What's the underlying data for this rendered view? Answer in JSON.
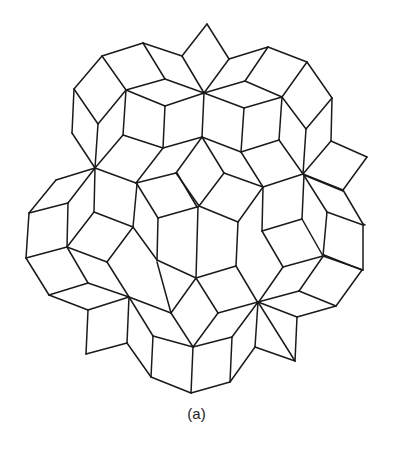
{
  "figure": {
    "caption": "(a)",
    "stroke_color": "#1a1a1a",
    "background": "#ffffff",
    "edges": [
      [
        207,
        24,
        182,
        56
      ],
      [
        207,
        24,
        229,
        59
      ],
      [
        182,
        56,
        204,
        93
      ],
      [
        229,
        59,
        204,
        93
      ],
      [
        143,
        43,
        182,
        56
      ],
      [
        143,
        43,
        102,
        56
      ],
      [
        102,
        56,
        74,
        89
      ],
      [
        143,
        43,
        165,
        79
      ],
      [
        102,
        56,
        126,
        90
      ],
      [
        74,
        89,
        98,
        124
      ],
      [
        74,
        89,
        72,
        133
      ],
      [
        98,
        124,
        126,
        90
      ],
      [
        126,
        90,
        165,
        79
      ],
      [
        165,
        79,
        204,
        93
      ],
      [
        126,
        90,
        165,
        106
      ],
      [
        165,
        106,
        204,
        93
      ],
      [
        229,
        59,
        268,
        47
      ],
      [
        268,
        47,
        307,
        62
      ],
      [
        307,
        62,
        332,
        98
      ],
      [
        268,
        47,
        245,
        81
      ],
      [
        245,
        81,
        204,
        93
      ],
      [
        245,
        81,
        282,
        97
      ],
      [
        307,
        62,
        282,
        97
      ],
      [
        282,
        97,
        306,
        129
      ],
      [
        332,
        98,
        306,
        129
      ],
      [
        332,
        98,
        331,
        141
      ],
      [
        204,
        93,
        244,
        108
      ],
      [
        244,
        108,
        282,
        97
      ],
      [
        126,
        90,
        123,
        135
      ],
      [
        165,
        106,
        163,
        148
      ],
      [
        204,
        93,
        202,
        137
      ],
      [
        244,
        108,
        241,
        152
      ],
      [
        282,
        97,
        279,
        140
      ],
      [
        123,
        135,
        163,
        148
      ],
      [
        163,
        148,
        202,
        137
      ],
      [
        202,
        137,
        241,
        152
      ],
      [
        241,
        152,
        279,
        140
      ],
      [
        98,
        124,
        95,
        168
      ],
      [
        72,
        133,
        95,
        168
      ],
      [
        123,
        135,
        95,
        168
      ],
      [
        306,
        129,
        303,
        174
      ],
      [
        279,
        140,
        303,
        174
      ],
      [
        331,
        141,
        303,
        174
      ],
      [
        95,
        168,
        136,
        183
      ],
      [
        136,
        183,
        163,
        148
      ],
      [
        136,
        183,
        176,
        173
      ],
      [
        176,
        173,
        202,
        137
      ],
      [
        202,
        137,
        224,
        173
      ],
      [
        224,
        173,
        263,
        187
      ],
      [
        263,
        187,
        241,
        152
      ],
      [
        263,
        187,
        303,
        174
      ],
      [
        176,
        173,
        199,
        206
      ],
      [
        224,
        173,
        199,
        206
      ],
      [
        331,
        141,
        367,
        157
      ],
      [
        367,
        157,
        343,
        190
      ],
      [
        303,
        174,
        343,
        190
      ],
      [
        343,
        190,
        363,
        224
      ],
      [
        303,
        174,
        327,
        212
      ],
      [
        327,
        212,
        363,
        225
      ],
      [
        95,
        168,
        56,
        180
      ],
      [
        56,
        180,
        29,
        213
      ],
      [
        95,
        168,
        68,
        203
      ],
      [
        29,
        213,
        68,
        203
      ],
      [
        95,
        168,
        94,
        212
      ],
      [
        68,
        203,
        67,
        247
      ],
      [
        29,
        213,
        26,
        258
      ],
      [
        94,
        212,
        133,
        227
      ],
      [
        133,
        227,
        137,
        184
      ],
      [
        136,
        183,
        137,
        184
      ],
      [
        94,
        212,
        67,
        247
      ],
      [
        26,
        258,
        67,
        247
      ],
      [
        26,
        258,
        49,
        295
      ],
      [
        67,
        247,
        88,
        283
      ],
      [
        49,
        295,
        88,
        283
      ],
      [
        67,
        247,
        107,
        262
      ],
      [
        107,
        262,
        133,
        227
      ],
      [
        88,
        283,
        129,
        297
      ],
      [
        107,
        262,
        129,
        297
      ],
      [
        133,
        227,
        157,
        260
      ],
      [
        137,
        184,
        158,
        218
      ],
      [
        158,
        218,
        157,
        260
      ],
      [
        158,
        218,
        197,
        207
      ],
      [
        177,
        173,
        197,
        207
      ],
      [
        199,
        206,
        238,
        222
      ],
      [
        238,
        222,
        263,
        187
      ],
      [
        238,
        222,
        236,
        266
      ],
      [
        197,
        207,
        198,
        207
      ],
      [
        157,
        260,
        196,
        278
      ],
      [
        196,
        278,
        236,
        266
      ],
      [
        198,
        207,
        196,
        278
      ],
      [
        262,
        231,
        302,
        219
      ],
      [
        263,
        187,
        262,
        231
      ],
      [
        302,
        219,
        304,
        175
      ],
      [
        304,
        175,
        343,
        191
      ],
      [
        302,
        219,
        323,
        256
      ],
      [
        262,
        231,
        283,
        267
      ],
      [
        283,
        267,
        323,
        256
      ],
      [
        236,
        266,
        258,
        303
      ],
      [
        283,
        267,
        258,
        303
      ],
      [
        327,
        212,
        323,
        256
      ],
      [
        363,
        225,
        363,
        270
      ],
      [
        323,
        256,
        363,
        270
      ],
      [
        49,
        295,
        88,
        310
      ],
      [
        88,
        310,
        129,
        297
      ],
      [
        88,
        310,
        86,
        354
      ],
      [
        86,
        354,
        127,
        343
      ],
      [
        129,
        297,
        127,
        343
      ],
      [
        129,
        297,
        153,
        336
      ],
      [
        127,
        343,
        151,
        377
      ],
      [
        153,
        336,
        151,
        377
      ],
      [
        129,
        297,
        171,
        313
      ],
      [
        157,
        262,
        171,
        313
      ],
      [
        171,
        313,
        196,
        278
      ],
      [
        171,
        313,
        193,
        347
      ],
      [
        196,
        278,
        218,
        313
      ],
      [
        218,
        313,
        258,
        302
      ],
      [
        218,
        313,
        193,
        347
      ],
      [
        153,
        336,
        193,
        347
      ],
      [
        193,
        347,
        232,
        337
      ],
      [
        232,
        337,
        258,
        302
      ],
      [
        193,
        347,
        191,
        393
      ],
      [
        151,
        377,
        191,
        393
      ],
      [
        191,
        393,
        230,
        382
      ],
      [
        232,
        337,
        230,
        382
      ],
      [
        230,
        382,
        255,
        347
      ],
      [
        255,
        347,
        258,
        302
      ],
      [
        258,
        302,
        295,
        361
      ],
      [
        255,
        347,
        295,
        361
      ],
      [
        258,
        302,
        297,
        317
      ],
      [
        297,
        317,
        295,
        361
      ],
      [
        258,
        302,
        299,
        291
      ],
      [
        299,
        291,
        336,
        306
      ],
      [
        297,
        317,
        336,
        306
      ],
      [
        336,
        306,
        362,
        270
      ],
      [
        324,
        255,
        362,
        270
      ],
      [
        299,
        291,
        324,
        255
      ],
      [
        363,
        224,
        365,
        225
      ]
    ]
  }
}
